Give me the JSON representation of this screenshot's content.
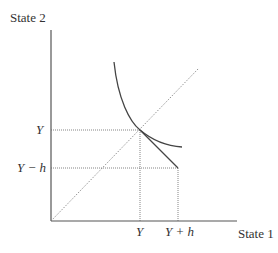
{
  "axes": {
    "y_label": "State 2",
    "x_label": "State 1"
  },
  "ticks": {
    "y": [
      "Y",
      "Y − h"
    ],
    "x": [
      "Y",
      "Y + h"
    ]
  },
  "elements": [
    "indifference-curve",
    "certainty-line-45deg",
    "budget-segment",
    "guide-lines"
  ]
}
